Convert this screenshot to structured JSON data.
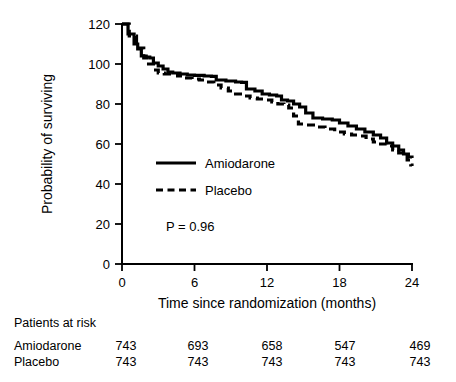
{
  "chart_data": {
    "type": "line",
    "title": "",
    "xlabel": "Time since randomization (months)",
    "ylabel": "Probability of surviving",
    "xlim": [
      0,
      24
    ],
    "ylim": [
      0,
      120
    ],
    "xticks": [
      0,
      6,
      12,
      18,
      24
    ],
    "yticks": [
      0,
      20,
      40,
      60,
      80,
      100,
      120
    ],
    "xtick_labels": [
      "0",
      "6",
      "12",
      "18",
      "24"
    ],
    "ytick_labels": [
      "0",
      "20",
      "40",
      "60",
      "80",
      "100",
      "120"
    ],
    "grid": false,
    "legend_position": "center-left",
    "annotations": [
      {
        "name": "p-value",
        "text": "P = 0.96",
        "x": 4.0,
        "y": 22
      }
    ],
    "series": [
      {
        "name": "Amiodarone",
        "style": "solid",
        "color": "#000000",
        "points": [
          [
            0.0,
            120.0
          ],
          [
            0.5,
            115.0
          ],
          [
            1.0,
            110.0
          ],
          [
            1.3,
            107.5
          ],
          [
            1.6,
            104.0
          ],
          [
            2.0,
            103.5
          ],
          [
            2.3,
            103.0
          ],
          [
            2.6,
            100.5
          ],
          [
            3.0,
            99.0
          ],
          [
            3.4,
            97.5
          ],
          [
            3.8,
            96.0
          ],
          [
            4.2,
            95.5
          ],
          [
            4.8,
            95.0
          ],
          [
            5.4,
            94.5
          ],
          [
            6.0,
            94.3
          ],
          [
            6.8,
            94.0
          ],
          [
            7.4,
            93.8
          ],
          [
            7.8,
            92.0
          ],
          [
            8.6,
            91.5
          ],
          [
            9.4,
            91.0
          ],
          [
            9.9,
            90.8
          ],
          [
            10.3,
            87.5
          ],
          [
            11.0,
            86.5
          ],
          [
            11.6,
            85.0
          ],
          [
            12.2,
            84.5
          ],
          [
            12.8,
            84.0
          ],
          [
            13.2,
            82.0
          ],
          [
            13.7,
            81.5
          ],
          [
            14.2,
            80.0
          ],
          [
            14.7,
            78.5
          ],
          [
            15.2,
            75.5
          ],
          [
            15.8,
            73.0
          ],
          [
            16.6,
            72.5
          ],
          [
            17.4,
            72.0
          ],
          [
            18.0,
            70.5
          ],
          [
            18.7,
            69.0
          ],
          [
            19.4,
            67.5
          ],
          [
            20.1,
            66.0
          ],
          [
            20.8,
            64.5
          ],
          [
            21.4,
            63.0
          ],
          [
            21.9,
            60.5
          ],
          [
            22.4,
            59.0
          ],
          [
            22.9,
            57.0
          ],
          [
            23.3,
            55.0
          ],
          [
            23.7,
            53.5
          ],
          [
            24.0,
            53.0
          ]
        ]
      },
      {
        "name": "Placebo",
        "style": "dashed",
        "color": "#000000",
        "points": [
          [
            0.0,
            120.0
          ],
          [
            0.6,
            114.0
          ],
          [
            1.2,
            108.0
          ],
          [
            1.8,
            103.0
          ],
          [
            2.2,
            100.0
          ],
          [
            2.6,
            97.0
          ],
          [
            3.0,
            95.5
          ],
          [
            3.5,
            95.0
          ],
          [
            4.0,
            95.0
          ],
          [
            4.6,
            94.0
          ],
          [
            5.2,
            93.0
          ],
          [
            5.8,
            92.5
          ],
          [
            6.4,
            92.0
          ],
          [
            7.0,
            91.0
          ],
          [
            7.6,
            89.5
          ],
          [
            8.2,
            88.0
          ],
          [
            8.8,
            86.5
          ],
          [
            9.4,
            85.0
          ],
          [
            10.0,
            84.0
          ],
          [
            10.6,
            83.0
          ],
          [
            11.2,
            82.5
          ],
          [
            11.8,
            82.0
          ],
          [
            12.4,
            81.0
          ],
          [
            12.9,
            80.0
          ],
          [
            13.4,
            79.5
          ],
          [
            13.8,
            78.0
          ],
          [
            14.2,
            74.0
          ],
          [
            14.6,
            70.0
          ],
          [
            15.2,
            69.5
          ],
          [
            16.0,
            68.5
          ],
          [
            16.8,
            67.5
          ],
          [
            17.6,
            66.0
          ],
          [
            18.4,
            65.0
          ],
          [
            19.0,
            64.5
          ],
          [
            19.6,
            64.0
          ],
          [
            20.2,
            62.5
          ],
          [
            20.8,
            61.0
          ],
          [
            21.4,
            60.0
          ],
          [
            21.9,
            59.0
          ],
          [
            22.4,
            57.0
          ],
          [
            22.9,
            55.5
          ],
          [
            23.3,
            54.5
          ],
          [
            23.6,
            52.0
          ],
          [
            23.9,
            49.5
          ],
          [
            24.0,
            49.0
          ]
        ]
      }
    ]
  },
  "risk_table": {
    "heading": "Patients at risk",
    "rows": [
      {
        "label": "Amiodarone",
        "values": [
          "743",
          "693",
          "658",
          "547",
          "469"
        ]
      },
      {
        "label": "Placebo",
        "values": [
          "743",
          "743",
          "743",
          "743",
          "743"
        ]
      }
    ]
  }
}
